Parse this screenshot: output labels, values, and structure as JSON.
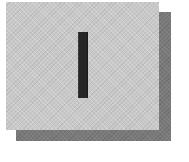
{
  "graphic": {
    "description": "Gray textured card with a dark vertical bar and an offset drop shadow",
    "glyph": "I",
    "colors": {
      "background": "#ffffff",
      "card": "#c9c9c9",
      "shadow": "#7a7a7a",
      "bar": "#262626"
    }
  }
}
